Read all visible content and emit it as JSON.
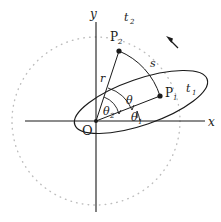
{
  "figure": {
    "background_color": "#ffffff",
    "ink_color": "#1a1a1a",
    "dotted_color": "#b9b9b9"
  },
  "axes": {
    "x_label": "x",
    "y_label": "y",
    "origin_label": "O",
    "x_axis": {
      "x1": 25,
      "y1": 121,
      "x2": 205,
      "y2": 121
    },
    "y_axis": {
      "x1": 96,
      "y1": 22,
      "x2": 96,
      "y2": 212
    },
    "x_label_pos": {
      "x": 209,
      "y": 125
    },
    "y_label_pos": {
      "x": 92,
      "y": 17
    },
    "origin_label_pos": {
      "x": 85,
      "y": 134
    }
  },
  "circle": {
    "name": "reference-circle",
    "center_x": 96,
    "center_y": 121,
    "radius": 84,
    "style": "dotted"
  },
  "ellipse": {
    "name": "orbit-ellipse",
    "center_x": 141,
    "center_y": 102,
    "semi_major": 70,
    "semi_minor": 23,
    "rotation_deg": -19
  },
  "points": [
    {
      "id": "P1",
      "label": "P",
      "subscript": "1",
      "time_label": "t",
      "time_subscript": "1",
      "x": 160,
      "y": 96,
      "label_pos": {
        "x": 166,
        "y": 94
      },
      "time_pos": {
        "x": 188,
        "y": 90
      }
    },
    {
      "id": "P2",
      "label": "P",
      "subscript": "2",
      "time_label": "t",
      "time_subscript": "2",
      "x": 119,
      "y": 51,
      "label_pos": {
        "x": 113,
        "y": 40
      },
      "time_pos": {
        "x": 126,
        "y": 20
      }
    }
  ],
  "segments": [
    {
      "name": "radius-to-P2",
      "x1": 96,
      "y1": 121,
      "x2": 119,
      "y2": 51
    },
    {
      "name": "radius-to-P1",
      "x1": 96,
      "y1": 121,
      "x2": 160,
      "y2": 96
    }
  ],
  "labels": {
    "radius": "r",
    "radius_pos": {
      "x": 102,
      "y": 79
    },
    "arc_length": "s",
    "arc_length_pos": {
      "x": 152,
      "y": 64
    },
    "theta": "θ",
    "theta_pos": {
      "x": 128,
      "y": 101
    },
    "theta1": "θ",
    "theta1_sub": "1",
    "theta1_pos": {
      "x": 133,
      "y": 118
    },
    "theta2": "θ",
    "theta2_sub": "2",
    "theta2_pos": {
      "x": 105,
      "y": 112
    }
  },
  "arcs": {
    "s_arc": {
      "name": "arc-s-between-P2-and-P1",
      "from_x": 119,
      "from_y": 51,
      "to_x": 160,
      "to_y": 96,
      "sweep_radius": 72
    },
    "theta_arc_radius": 38,
    "theta1_arc_radius": 44,
    "theta2_arc_radius": 25
  },
  "direction_arrow": {
    "name": "motion-direction-arrow",
    "from_x": 178,
    "from_y": 47,
    "to_x": 168,
    "to_y": 38
  }
}
